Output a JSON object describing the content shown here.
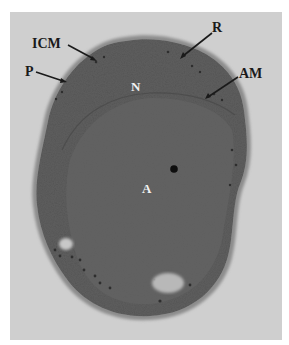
{
  "figure": {
    "type": "electron-micrograph",
    "colors": {
      "page_background": "#ffffff",
      "frame_background": "#cfcfcf",
      "cell_halo": "#8c8c8c",
      "cell_body": "#5e5e5e",
      "inner_region": "#626262",
      "label_dark": "#1a1a1a",
      "label_light": "#f2f2f2"
    },
    "labels": [
      {
        "id": "ICM",
        "text": "ICM",
        "x": 32,
        "y": 37,
        "style": "dark",
        "arrow": [
          68,
          45,
          96,
          60
        ]
      },
      {
        "id": "P",
        "text": "P",
        "x": 25,
        "y": 65,
        "style": "dark",
        "arrow": [
          36,
          72,
          66,
          82
        ]
      },
      {
        "id": "R",
        "text": "R",
        "x": 212,
        "y": 21,
        "style": "dark",
        "arrow": [
          212,
          33,
          181,
          58
        ]
      },
      {
        "id": "AM",
        "text": "AM",
        "x": 239,
        "y": 67,
        "style": "dark",
        "arrow": [
          238,
          77,
          206,
          98
        ]
      },
      {
        "id": "N",
        "text": "N",
        "x": 131,
        "y": 80,
        "style": "light"
      },
      {
        "id": "A",
        "text": "A",
        "x": 142,
        "y": 182,
        "style": "light"
      }
    ]
  }
}
